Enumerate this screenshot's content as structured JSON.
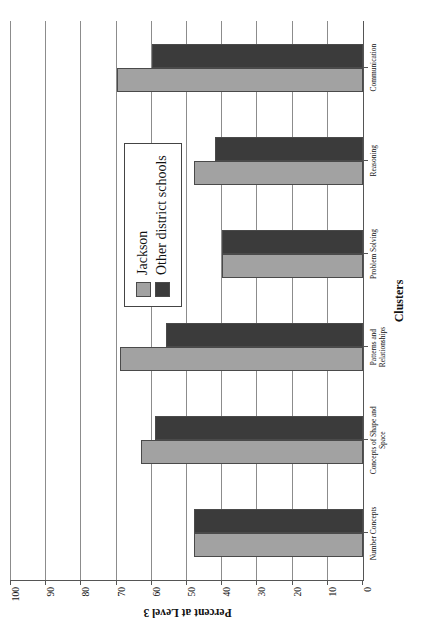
{
  "chart_data": {
    "type": "bar",
    "title": "",
    "xlabel": "Clusters",
    "ylabel": "Percent at Level 3",
    "categories": [
      "Number Concepts",
      "Concepts of Shape and\nSpace",
      "Patterns and\nRelationships",
      "Problem Solving",
      "Reasoning",
      "Communication"
    ],
    "series": [
      {
        "name": "Jackson",
        "color": "#a2a2a2",
        "values": [
          48,
          63,
          69,
          40,
          48,
          70
        ]
      },
      {
        "name": "Other district schools",
        "color": "#3b3b3b",
        "values": [
          48,
          59,
          56,
          40,
          42,
          60
        ]
      }
    ],
    "ylim": [
      0,
      100
    ],
    "yticks": [
      0,
      10,
      20,
      30,
      40,
      50,
      60,
      70,
      80,
      90,
      100
    ],
    "ytick_labels": [
      "0",
      "10",
      "20",
      "30",
      "40",
      "50",
      "60",
      "70",
      "80",
      "90",
      "100"
    ],
    "grid": true,
    "legend_position": "upper-right-inside",
    "orientation": "page-rotated-90-ccw"
  },
  "legend": {
    "entries": [
      {
        "label": "Jackson",
        "swatch": "legend-swatch-jackson"
      },
      {
        "label": "Other district schools",
        "swatch": "legend-swatch-other-district-schools"
      }
    ]
  }
}
